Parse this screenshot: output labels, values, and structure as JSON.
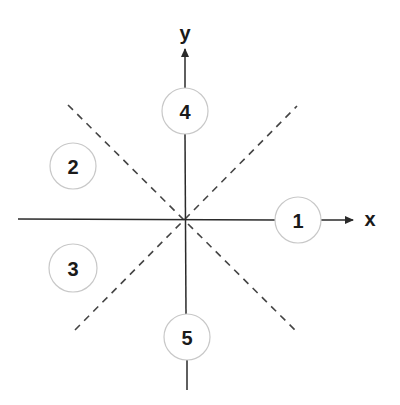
{
  "diagram": {
    "axes": {
      "x_label": "x",
      "y_label": "y",
      "origin": [
        185,
        218
      ],
      "color": "#2a2a2a"
    },
    "regions": [
      {
        "id": "1",
        "label": "1",
        "cx": 298,
        "cy": 220,
        "position": "right, on +x axis"
      },
      {
        "id": "2",
        "label": "2",
        "cx": 73,
        "cy": 166,
        "position": "upper-left"
      },
      {
        "id": "3",
        "label": "3",
        "cx": 73,
        "cy": 268,
        "position": "lower-left"
      },
      {
        "id": "4",
        "label": "4",
        "cx": 185,
        "cy": 111,
        "position": "top, on +y axis"
      },
      {
        "id": "5",
        "label": "5",
        "cx": 187,
        "cy": 337,
        "position": "bottom, on -y axis"
      }
    ],
    "circle_radius": 23,
    "circle_stroke": "#c8c8c8",
    "dashed_lines": [
      {
        "from": [
          68,
          105
        ],
        "to": [
          297,
          332
        ]
      },
      {
        "from": [
          75,
          330
        ],
        "to": [
          297,
          106
        ]
      }
    ],
    "dash_color": "#444444"
  }
}
